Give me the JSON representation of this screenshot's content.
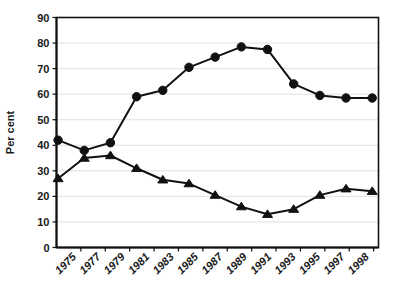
{
  "chart_data": {
    "type": "line",
    "title": "",
    "xlabel": "",
    "ylabel": "Per cent",
    "ylim": [
      0,
      90
    ],
    "ytick_step": 10,
    "yticks": [
      0,
      10,
      20,
      30,
      40,
      50,
      60,
      70,
      80,
      90
    ],
    "grid": true,
    "legend": "none",
    "categories": [
      "1975",
      "1977",
      "1979",
      "1981",
      "1983",
      "1985",
      "1987",
      "1989",
      "1991",
      "1993",
      "1995",
      "1997",
      "1998"
    ],
    "x": [
      "1975",
      "1977",
      "1979",
      "1981",
      "1983",
      "1985",
      "1987",
      "1989",
      "1991",
      "1993",
      "1995",
      "1997",
      "1998"
    ],
    "series": [
      {
        "name": "circle-series",
        "marker": "circle",
        "color": "#111111",
        "values": [
          42,
          38,
          41,
          59,
          61.5,
          70.5,
          74.5,
          78.5,
          77.5,
          64,
          59.5,
          58.5,
          58.5
        ]
      },
      {
        "name": "triangle-series",
        "marker": "triangle",
        "color": "#111111",
        "values": [
          27,
          35,
          36,
          31,
          26.5,
          25,
          20.5,
          16,
          13,
          15,
          20.5,
          23,
          22
        ]
      }
    ]
  },
  "axis": {
    "y_title": "Per cent",
    "y_tick_labels": [
      "90",
      "80",
      "70",
      "60",
      "50",
      "40",
      "30",
      "20",
      "10",
      "0"
    ],
    "x_tick_labels": [
      "1975",
      "1977",
      "1979",
      "1981",
      "1983",
      "1985",
      "1987",
      "1989",
      "1991",
      "1993",
      "1995",
      "1997",
      "1998"
    ]
  },
  "style": {
    "line_color": "#111111",
    "grid_color": "#d8d8d8",
    "axis_color": "#111111",
    "background": "#ffffff"
  }
}
